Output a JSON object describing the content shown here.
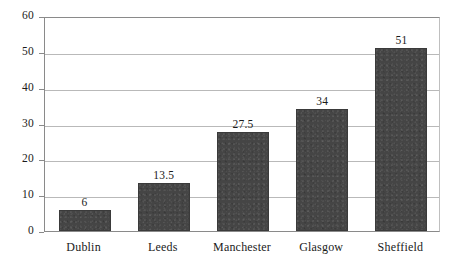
{
  "chart_data": {
    "type": "bar",
    "title": "",
    "subtitle": "",
    "xlabel": "",
    "ylabel": "",
    "categories": [
      "Dublin",
      "Leeds",
      "Manchester",
      "Glasgow",
      "Sheffield"
    ],
    "values": [
      6,
      13.5,
      27.5,
      34,
      51
    ],
    "value_labels": [
      "6",
      "13.5",
      "27.5",
      "34",
      "51"
    ],
    "ylim": [
      0,
      60
    ],
    "y_ticks": [
      0,
      10,
      20,
      30,
      40,
      50,
      60
    ],
    "y_tick_labels": [
      "0",
      "10",
      "20",
      "30",
      "40",
      "50",
      "60"
    ],
    "grid": true,
    "grid_axis": "y",
    "legend": false,
    "legend_position": "none",
    "bar_color": "#454545",
    "bar_edge_color": "#3a3a3a",
    "grid_color": "#b9b9b9",
    "axis_color": "#8a8a8a",
    "background_color": "#ffffff",
    "text_color": "#1a1a1a"
  }
}
